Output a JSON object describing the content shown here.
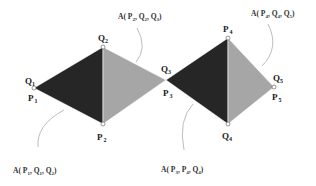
{
  "diagram": {
    "colors": {
      "dark": "#262626",
      "light": "#a6a6a6",
      "edge": "#ffffff",
      "arrow": "#bdbdbd",
      "background": "#ffffff"
    },
    "vertices": {
      "v1": {
        "x": 34,
        "y": 88,
        "top_label": "Q",
        "top_sub": "1",
        "bottom_label": "P",
        "bottom_sub": "1"
      },
      "v2_top": {
        "x": 103,
        "y": 47,
        "label": "Q",
        "sub": "2"
      },
      "v2_bottom": {
        "x": 103,
        "y": 124,
        "label": "P",
        "sub": "2"
      },
      "v3": {
        "x": 166,
        "y": 80,
        "top_label": "Q",
        "top_sub": "3",
        "bottom_label": "P",
        "bottom_sub": "3"
      },
      "v4_top": {
        "x": 228,
        "y": 38,
        "label": "P",
        "sub": "4"
      },
      "v4_bottom": {
        "x": 228,
        "y": 124,
        "label": "Q",
        "sub": "4"
      },
      "v5": {
        "x": 274,
        "y": 87,
        "top_label": "Q",
        "top_sub": "5",
        "bottom_label": "P",
        "bottom_sub": "5"
      }
    },
    "triangles": [
      {
        "name": "A(P1, Q1, Q2)",
        "fill": "dark"
      },
      {
        "name": "A(P2, Q2, Q3)",
        "fill": "light"
      },
      {
        "name": "A(P3, P4, Q4)",
        "fill": "dark"
      },
      {
        "name": "A(P4, Q4, Q5)",
        "fill": "light"
      }
    ],
    "annotations": [
      {
        "prefix": "A( ",
        "parts": [
          [
            "P",
            "2"
          ],
          [
            "Q",
            "2"
          ],
          [
            "Q",
            "3"
          ]
        ],
        "suffix": ")",
        "position": "top-left"
      },
      {
        "prefix": "A( ",
        "parts": [
          [
            "P",
            "4"
          ],
          [
            "Q",
            "4"
          ],
          [
            "Q",
            "5"
          ]
        ],
        "suffix": ")",
        "position": "top-right"
      },
      {
        "prefix": "A( ",
        "parts": [
          [
            "P",
            "1"
          ],
          [
            "Q",
            "1"
          ],
          [
            "Q",
            "2"
          ]
        ],
        "suffix": ")",
        "position": "bottom-left"
      },
      {
        "prefix": "A( ",
        "parts": [
          [
            "P",
            "3"
          ],
          [
            "P",
            "4"
          ],
          [
            "Q",
            "4"
          ]
        ],
        "suffix": ")",
        "position": "bottom-right"
      }
    ]
  }
}
